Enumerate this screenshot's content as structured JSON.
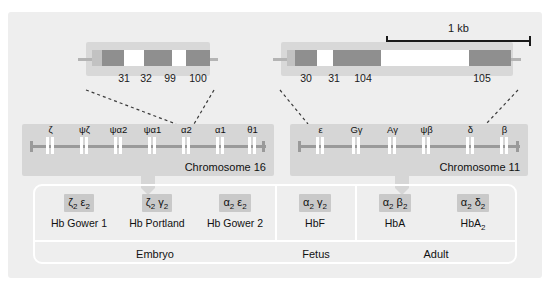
{
  "figure": {
    "scale_label": "1 kb"
  },
  "expanded_genes": [
    {
      "name": "alpha-globin-expanded",
      "codons": [
        "31",
        "32",
        "99",
        "100"
      ]
    },
    {
      "name": "beta-globin-expanded",
      "codons": [
        "30",
        "31",
        "104",
        "105"
      ]
    }
  ],
  "clusters": [
    {
      "name": "alpha-globin-cluster",
      "chromosome_label": "Chromosome 16",
      "genes": [
        {
          "symbol": "ζ"
        },
        {
          "symbol": "ψζ"
        },
        {
          "symbol": "ψα2"
        },
        {
          "symbol": "ψα1"
        },
        {
          "symbol": "α2"
        },
        {
          "symbol": "α1"
        },
        {
          "symbol": "θ1"
        }
      ]
    },
    {
      "name": "beta-globin-cluster",
      "chromosome_label": "Chromosome 11",
      "genes": [
        {
          "symbol": "ε"
        },
        {
          "symbol": "Gγ"
        },
        {
          "symbol": "Aγ"
        },
        {
          "symbol": "ψβ"
        },
        {
          "symbol": "δ"
        },
        {
          "symbol": "β"
        }
      ]
    }
  ],
  "hemoglobins": [
    {
      "chain1": "ζ",
      "sub1": "2",
      "chain2": "ε",
      "sub2": "2",
      "name": "Hb Gower 1",
      "name_sub": ""
    },
    {
      "chain1": "ζ",
      "sub1": "2",
      "chain2": "γ",
      "sub2": "2",
      "name": "Hb Portland",
      "name_sub": ""
    },
    {
      "chain1": "α",
      "sub1": "2",
      "chain2": "ε",
      "sub2": "2",
      "name": "Hb Gower 2",
      "name_sub": ""
    },
    {
      "chain1": "α",
      "sub1": "2",
      "chain2": "γ",
      "sub2": "2",
      "name": "HbF",
      "name_sub": ""
    },
    {
      "chain1": "α",
      "sub1": "2",
      "chain2": "β",
      "sub2": "2",
      "name": "HbA",
      "name_sub": ""
    },
    {
      "chain1": "α",
      "sub1": "2",
      "chain2": "δ",
      "sub2": "2",
      "name": "HbA",
      "name_sub": "2"
    }
  ],
  "stages": [
    {
      "label": "Embryo"
    },
    {
      "label": "Fetus"
    },
    {
      "label": "Adult"
    }
  ]
}
